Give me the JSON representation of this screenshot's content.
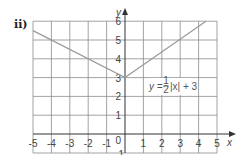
{
  "part_label": "ii)",
  "chart_data": {
    "type": "line",
    "title": "",
    "xlabel": "x",
    "ylabel": "y",
    "xlim": [
      -5,
      5
    ],
    "ylim": [
      -1,
      6
    ],
    "grid": true,
    "x_ticks": [
      "-5",
      "-4",
      "-3",
      "-2",
      "-1",
      "1",
      "2",
      "3",
      "4",
      "5"
    ],
    "y_ticks": [
      "1",
      "2",
      "3",
      "4",
      "5",
      "6"
    ],
    "origin_label": "0",
    "below_axis_label": "-1",
    "series": [
      {
        "name": "y = 1/2|x| + 3",
        "x": [
          -5,
          0,
          4.4
        ],
        "y": [
          5.5,
          3,
          6
        ]
      }
    ],
    "annotation": {
      "prefix": "y =",
      "fraction_num": "1",
      "fraction_den": "2",
      "suffix": "|x| + 3"
    },
    "colors": {
      "grid": "#8c8c8c",
      "axis": "#333333",
      "line": "#9a9a9a"
    }
  }
}
